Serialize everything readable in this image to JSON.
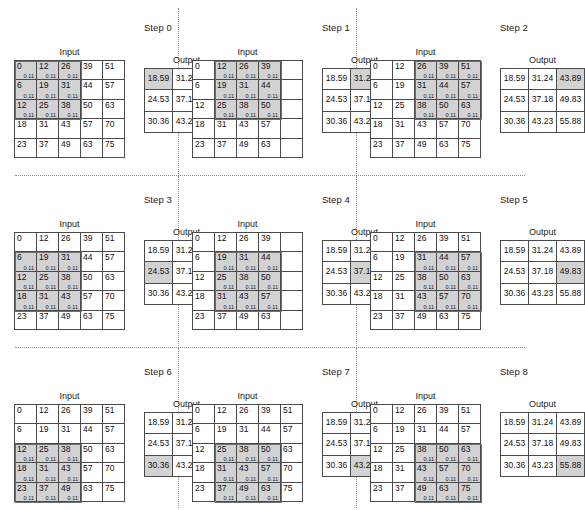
{
  "figure": {
    "grid_line_color": "#4a4a4a",
    "highlight_color": "#d2d2d2",
    "separator_color": "#8a8a8a",
    "input_label": "Input",
    "output_label": "Output",
    "weight_label": "0.11",
    "input_values": [
      [
        "0",
        "12",
        "26",
        "39",
        "51"
      ],
      [
        "6",
        "19",
        "31",
        "44",
        "57"
      ],
      [
        "12",
        "25",
        "38",
        "50",
        "63"
      ],
      [
        "18",
        "31",
        "43",
        "57",
        "70"
      ],
      [
        "23",
        "37",
        "49",
        "63",
        "75"
      ]
    ],
    "output_values": [
      [
        "18.59",
        "31.24",
        "43.89"
      ],
      [
        "24.53",
        "37.18",
        "49.83"
      ],
      [
        "30.36",
        "43.23",
        "55.88"
      ]
    ],
    "steps": [
      {
        "label": "Step 0",
        "kernel_row": 0,
        "kernel_col": 0,
        "output_row": 0,
        "output_col": 0,
        "hidden_input_cols": []
      },
      {
        "label": "Step 1",
        "kernel_row": 0,
        "kernel_col": 1,
        "output_row": 0,
        "output_col": 1,
        "hidden_input_cols": [
          4
        ]
      },
      {
        "label": "Step 2",
        "kernel_row": 0,
        "kernel_col": 2,
        "output_row": 0,
        "output_col": 2,
        "hidden_input_cols": []
      },
      {
        "label": "Step 3",
        "kernel_row": 1,
        "kernel_col": 0,
        "output_row": 1,
        "output_col": 0,
        "hidden_input_cols": []
      },
      {
        "label": "Step 4",
        "kernel_row": 1,
        "kernel_col": 1,
        "output_row": 1,
        "output_col": 1,
        "hidden_input_cols": [
          4
        ]
      },
      {
        "label": "Step 5",
        "kernel_row": 1,
        "kernel_col": 2,
        "output_row": 1,
        "output_col": 2,
        "hidden_input_cols": []
      },
      {
        "label": "Step 6",
        "kernel_row": 2,
        "kernel_col": 0,
        "output_row": 2,
        "output_col": 0,
        "hidden_input_cols": []
      },
      {
        "label": "Step 7",
        "kernel_row": 2,
        "kernel_col": 1,
        "output_row": 2,
        "output_col": 1,
        "hidden_input_cols": []
      },
      {
        "label": "Step 8",
        "kernel_row": 2,
        "kernel_col": 2,
        "output_row": 2,
        "output_col": 2,
        "hidden_input_cols": []
      }
    ]
  },
  "chart_data": {
    "type": "heatmap",
    "xlabel": "",
    "ylabel": "",
    "grid": true,
    "legend": "none",
    "kernel_size": [
      3,
      3
    ],
    "kernel_weight": 0.11,
    "input_matrix": [
      [
        0,
        12,
        26,
        39,
        51
      ],
      [
        6,
        19,
        31,
        44,
        57
      ],
      [
        12,
        25,
        38,
        50,
        63
      ],
      [
        18,
        31,
        43,
        57,
        70
      ],
      [
        23,
        37,
        49,
        63,
        75
      ]
    ],
    "output_matrix": [
      [
        18.59,
        31.24,
        43.89
      ],
      [
        24.53,
        37.18,
        49.83
      ],
      [
        30.36,
        43.23,
        55.88
      ]
    ],
    "steps": [
      {
        "label": "Step 0",
        "kernel_top_left": [
          0,
          0
        ],
        "output_cell": [
          0,
          0
        ],
        "output_value": 18.59
      },
      {
        "label": "Step 1",
        "kernel_top_left": [
          0,
          1
        ],
        "output_cell": [
          0,
          1
        ],
        "output_value": 31.24
      },
      {
        "label": "Step 2",
        "kernel_top_left": [
          0,
          2
        ],
        "output_cell": [
          0,
          2
        ],
        "output_value": 43.89
      },
      {
        "label": "Step 3",
        "kernel_top_left": [
          1,
          0
        ],
        "output_cell": [
          1,
          0
        ],
        "output_value": 24.53
      },
      {
        "label": "Step 4",
        "kernel_top_left": [
          1,
          1
        ],
        "output_cell": [
          1,
          1
        ],
        "output_value": 37.18
      },
      {
        "label": "Step 5",
        "kernel_top_left": [
          1,
          2
        ],
        "output_cell": [
          1,
          2
        ],
        "output_value": 49.83
      },
      {
        "label": "Step 6",
        "kernel_top_left": [
          2,
          0
        ],
        "output_cell": [
          2,
          0
        ],
        "output_value": 30.36
      },
      {
        "label": "Step 7",
        "kernel_top_left": [
          2,
          1
        ],
        "output_cell": [
          2,
          1
        ],
        "output_value": 43.23
      },
      {
        "label": "Step 8",
        "kernel_top_left": [
          2,
          2
        ],
        "output_cell": [
          2,
          2
        ],
        "output_value": 55.88
      }
    ]
  }
}
